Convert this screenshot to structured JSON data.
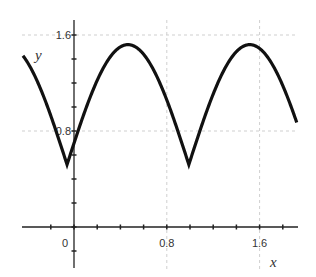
{
  "chart_data": {
    "type": "line",
    "title": "",
    "xlabel": "x",
    "ylabel": "y",
    "xlim": [
      -0.44,
      1.92
    ],
    "ylim": [
      -0.34,
      1.72
    ],
    "grid": true,
    "x_tick_labels": [
      "0",
      "0.8",
      "1.6"
    ],
    "x_tick_label_values": [
      0,
      0.8,
      1.6
    ],
    "y_tick_labels": [
      "0.8",
      "1.6"
    ],
    "y_tick_label_values": [
      0.8,
      1.6
    ],
    "minor_tick_step": 0.2,
    "series": [
      {
        "name": "y",
        "description": "periodic |sin| shaped curve: y = 0.52 + |sin(pi*(x+0.06)/1.05)|",
        "x": [
          -0.44,
          -0.36,
          -0.28,
          -0.2,
          -0.12,
          -0.06,
          0.0,
          0.1,
          0.2,
          0.3,
          0.4,
          0.465,
          0.55,
          0.65,
          0.75,
          0.85,
          0.95,
          0.99,
          1.05,
          1.15,
          1.25,
          1.35,
          1.45,
          1.515,
          1.6,
          1.7,
          1.8,
          1.92
        ],
        "y": [
          1.43,
          1.31,
          1.14,
          0.9,
          0.63,
          0.52,
          0.7,
          0.98,
          1.2,
          1.38,
          1.49,
          1.52,
          1.5,
          1.39,
          1.21,
          0.98,
          0.71,
          0.56,
          0.71,
          0.98,
          1.2,
          1.38,
          1.49,
          1.52,
          1.49,
          1.39,
          1.21,
          0.88
        ]
      }
    ],
    "minima": [
      {
        "x": -0.06,
        "y": 0.52
      },
      {
        "x": 0.99,
        "y": 0.52
      }
    ],
    "maxima": [
      {
        "x": 0.465,
        "y": 1.52
      },
      {
        "x": 1.515,
        "y": 1.52
      }
    ]
  }
}
